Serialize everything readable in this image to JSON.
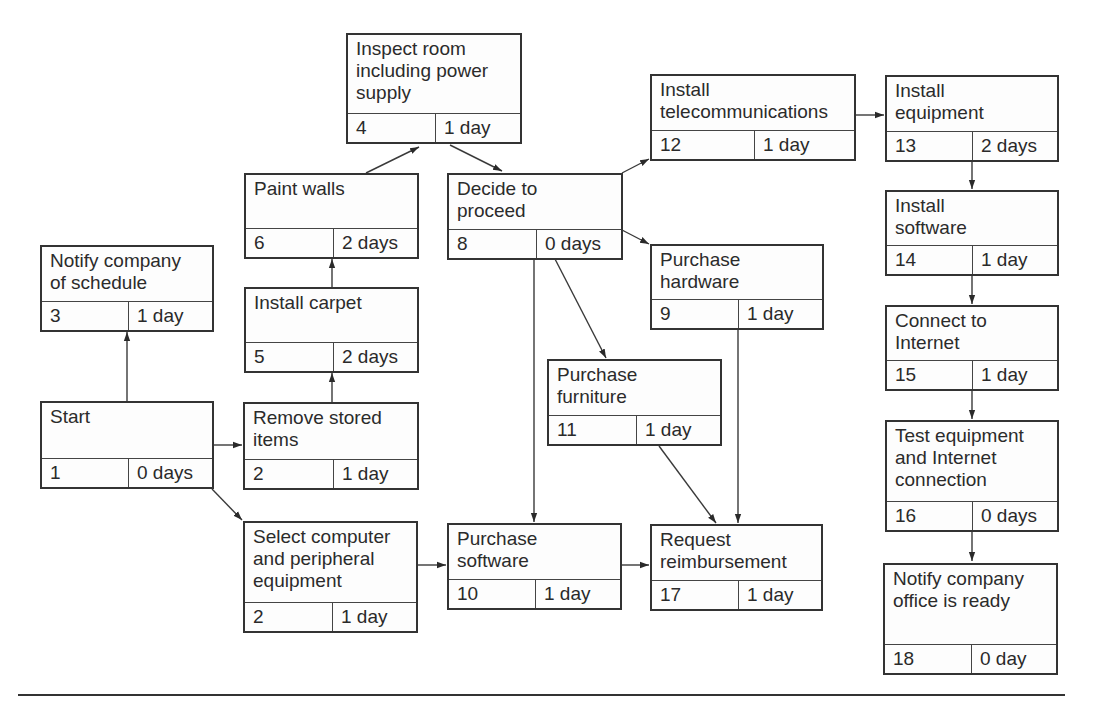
{
  "diagram": {
    "type": "activity-on-node network diagram",
    "nodes": [
      {
        "id": "1",
        "title": "Start",
        "number": "1",
        "duration": "0 days"
      },
      {
        "id": "2a",
        "title": "Remove stored\nitems",
        "number": "2",
        "duration": "1 day"
      },
      {
        "id": "2b",
        "title": "Select computer\nand peripheral\nequipment",
        "number": "2",
        "duration": "1 day"
      },
      {
        "id": "3",
        "title": "Notify company\nof schedule",
        "number": "3",
        "duration": "1 day"
      },
      {
        "id": "4",
        "title": "Inspect room\nincluding power\nsupply",
        "number": "4",
        "duration": "1 day"
      },
      {
        "id": "5",
        "title": "Install carpet",
        "number": "5",
        "duration": "2 days"
      },
      {
        "id": "6",
        "title": "Paint walls",
        "number": "6",
        "duration": "2 days"
      },
      {
        "id": "8",
        "title": "Decide to\nproceed",
        "number": "8",
        "duration": "0 days"
      },
      {
        "id": "9",
        "title": "Purchase\nhardware",
        "number": "9",
        "duration": "1 day"
      },
      {
        "id": "10",
        "title": "Purchase\nsoftware",
        "number": "10",
        "duration": "1 day"
      },
      {
        "id": "11",
        "title": "Purchase\nfurniture",
        "number": "11",
        "duration": "1 day"
      },
      {
        "id": "12",
        "title": "Install\ntelecommunications",
        "number": "12",
        "duration": "1 day"
      },
      {
        "id": "13",
        "title": "Install\nequipment",
        "number": "13",
        "duration": "2 days"
      },
      {
        "id": "14",
        "title": "Install\nsoftware",
        "number": "14",
        "duration": "1 day"
      },
      {
        "id": "15",
        "title": "Connect to\nInternet",
        "number": "15",
        "duration": "1 day"
      },
      {
        "id": "16",
        "title": "Test equipment\nand Internet\nconnection",
        "number": "16",
        "duration": "0 days"
      },
      {
        "id": "17",
        "title": "Request\nreimbursement",
        "number": "17",
        "duration": "1 day"
      },
      {
        "id": "18",
        "title": "Notify company\noffice is ready",
        "number": "18",
        "duration": "0 day"
      }
    ],
    "edges": [
      {
        "from": "1",
        "to": "3"
      },
      {
        "from": "1",
        "to": "2a"
      },
      {
        "from": "1",
        "to": "2b"
      },
      {
        "from": "2a",
        "to": "5"
      },
      {
        "from": "5",
        "to": "6"
      },
      {
        "from": "6",
        "to": "4"
      },
      {
        "from": "4",
        "to": "8"
      },
      {
        "from": "8",
        "to": "12"
      },
      {
        "from": "8",
        "to": "9"
      },
      {
        "from": "8",
        "to": "11"
      },
      {
        "from": "8",
        "to": "10"
      },
      {
        "from": "2b",
        "to": "10"
      },
      {
        "from": "10",
        "to": "17"
      },
      {
        "from": "11",
        "to": "17"
      },
      {
        "from": "9",
        "to": "17"
      },
      {
        "from": "12",
        "to": "13"
      },
      {
        "from": "13",
        "to": "14"
      },
      {
        "from": "14",
        "to": "15"
      },
      {
        "from": "15",
        "to": "16"
      },
      {
        "from": "16",
        "to": "18"
      }
    ]
  }
}
